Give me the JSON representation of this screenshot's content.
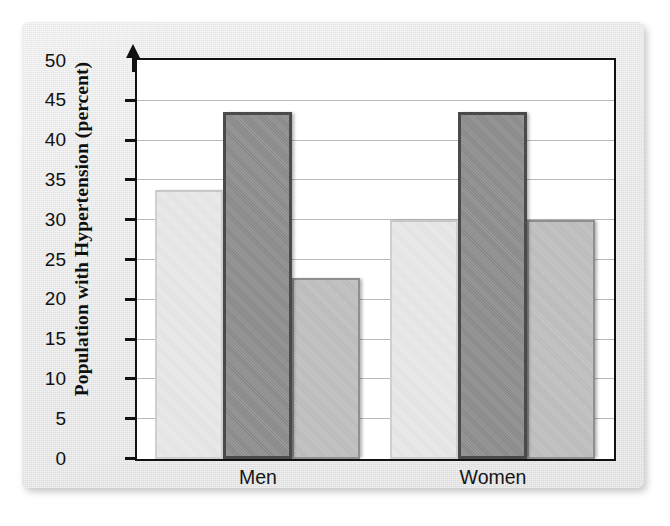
{
  "chart_data": {
    "type": "bar",
    "title": "",
    "subtitle": "",
    "xlabel": "",
    "ylabel": "Population with Hypertension (percent)",
    "categories": [
      "Men",
      "Women"
    ],
    "series": [
      {
        "name": "series-1",
        "color": "#e9e9e9",
        "values": [
          33.8,
          30.0
        ]
      },
      {
        "name": "series-2",
        "color": "#8d8d8d",
        "values": [
          43.6,
          43.6
        ]
      },
      {
        "name": "series-3",
        "color": "#c0c0c0",
        "values": [
          22.8,
          30.0
        ]
      }
    ],
    "ylim": [
      0,
      50
    ],
    "ytick_step": 5,
    "yticks": [
      0,
      5,
      10,
      15,
      20,
      25,
      30,
      35,
      40,
      45,
      50
    ],
    "ytick_labels": [
      "0",
      "5",
      "10",
      "15",
      "20",
      "25",
      "30",
      "35",
      "40",
      "45",
      "50"
    ],
    "grid": true,
    "grid_axis": "y",
    "legend": "none",
    "legend_position": "none",
    "annotations": [],
    "axis_arrow": "y-axis has an upward arrowhead at the top"
  },
  "colors": {
    "page_background": "#ffffff",
    "panel_background": "#e6e6e6",
    "plot_background": "#ffffff",
    "axis": "#111111",
    "gridline": "#b9b9b9",
    "text": "#111111",
    "bar_light": "#e9e9e9",
    "bar_dark": "#8d8d8d",
    "bar_medium": "#c0c0c0"
  }
}
